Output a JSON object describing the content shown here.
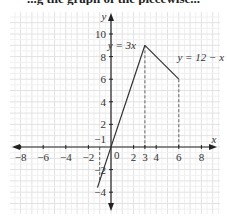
{
  "caption_fragment": "...g the graph of the piecewise...",
  "chart_data": {
    "type": "line",
    "title": "",
    "xlabel": "x",
    "ylabel": "y",
    "xlim": [
      -9,
      10
    ],
    "ylim": [
      -5.5,
      11
    ],
    "grid": true,
    "x_ticks": [
      -8,
      -6,
      -4,
      -2,
      2,
      4,
      6,
      8
    ],
    "x_extra_ticks": [
      3
    ],
    "y_ticks": [
      -4,
      -2,
      2,
      4,
      6,
      8,
      10
    ],
    "origin_label": "0",
    "extra_label": "−1",
    "series": [
      {
        "name": "y = 3x",
        "points": [
          [
            -1.2,
            -3.6
          ],
          [
            3,
            9
          ]
        ]
      },
      {
        "name": "y = 12 − x",
        "points": [
          [
            3,
            9
          ],
          [
            6,
            6
          ]
        ]
      }
    ],
    "dashed_guides": [
      {
        "x": -1,
        "from_y": 0,
        "to_y": -3
      },
      {
        "x": 3,
        "from_y": 9,
        "to_y": 0
      },
      {
        "x": 6,
        "from_y": 6,
        "to_y": 0
      }
    ],
    "annotations": [
      {
        "text": "y = 3x",
        "near": [
          1.5,
          9
        ]
      },
      {
        "text": "y = 12 − x",
        "near": [
          6.5,
          8
        ]
      }
    ]
  }
}
